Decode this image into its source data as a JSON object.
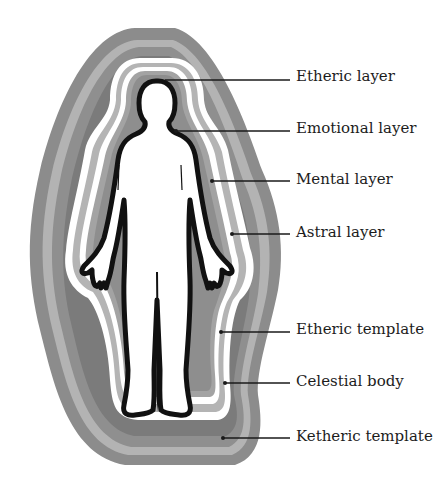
{
  "diagram": {
    "colors": {
      "band_outer": "#8a8a8a",
      "band_light": "#b5b5b5",
      "band_dark": "#7a7a7a",
      "band_mid": "#a3a3a3",
      "band_white": "#ffffff",
      "body_outline": "#111111",
      "body_fill": "#ffffff"
    },
    "labels": [
      {
        "id": "etheric-layer",
        "text": "Etheric layer",
        "y": 76
      },
      {
        "id": "emotional-layer",
        "text": "Emotional layer",
        "y": 128
      },
      {
        "id": "mental-layer",
        "text": "Mental layer",
        "y": 180
      },
      {
        "id": "astral-layer",
        "text": "Astral layer",
        "y": 232
      },
      {
        "id": "etheric-template",
        "text": "Etheric template",
        "y": 329
      },
      {
        "id": "celestial-body",
        "text": "Celestial body",
        "y": 383
      },
      {
        "id": "ketheric-template",
        "text": "Ketheric template",
        "y": 437
      }
    ]
  }
}
